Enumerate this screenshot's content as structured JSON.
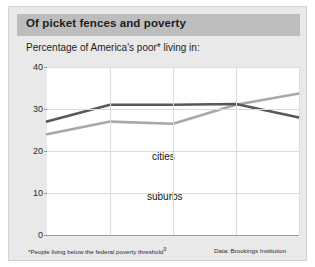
{
  "header": {
    "title": "Of picket fences and poverty",
    "subtitle": "Percentage of America's poor* living in:"
  },
  "footer": {
    "footnote_prefix": "*People living below the federal poverty threshold",
    "footnote_marker": "9",
    "source": "Data: Brookings Institution"
  },
  "chart_data": {
    "type": "line",
    "title": "Of picket fences and poverty",
    "subtitle": "Percentage of America's poor* living in:",
    "xlabel": "",
    "ylabel": "",
    "x": [
      1970,
      1980,
      1990,
      2000,
      2010
    ],
    "xlim": [
      1970,
      2010
    ],
    "ylim": [
      0,
      40
    ],
    "yticks": [
      0,
      10,
      20,
      30,
      40
    ],
    "xticks": [
      1970,
      1980,
      1990,
      2000,
      2010
    ],
    "grid": true,
    "legend": "inline-labels",
    "series": [
      {
        "name": "cities",
        "color": "#585858",
        "values": [
          27.0,
          31.0,
          31.0,
          31.2,
          28.0
        ],
        "label_text": "cities"
      },
      {
        "name": "suburbs",
        "color": "#a8a8a8",
        "values": [
          24.0,
          27.0,
          26.5,
          31.0,
          33.7
        ],
        "label_text": "suburbs"
      }
    ]
  },
  "axis": {
    "y_labels": [
      "40",
      "30",
      "20",
      "10",
      "0"
    ],
    "x_labels": [
      "1970",
      "1980",
      "1990",
      "2000",
      "2010"
    ]
  },
  "colors": {
    "header_bar": "#bdbdbd",
    "panel": "#e9e9e9",
    "plot_bg": "#ffffff",
    "cities_line": "#585858",
    "suburbs_line": "#a8a8a8",
    "gridline": "#dcdcdc"
  }
}
